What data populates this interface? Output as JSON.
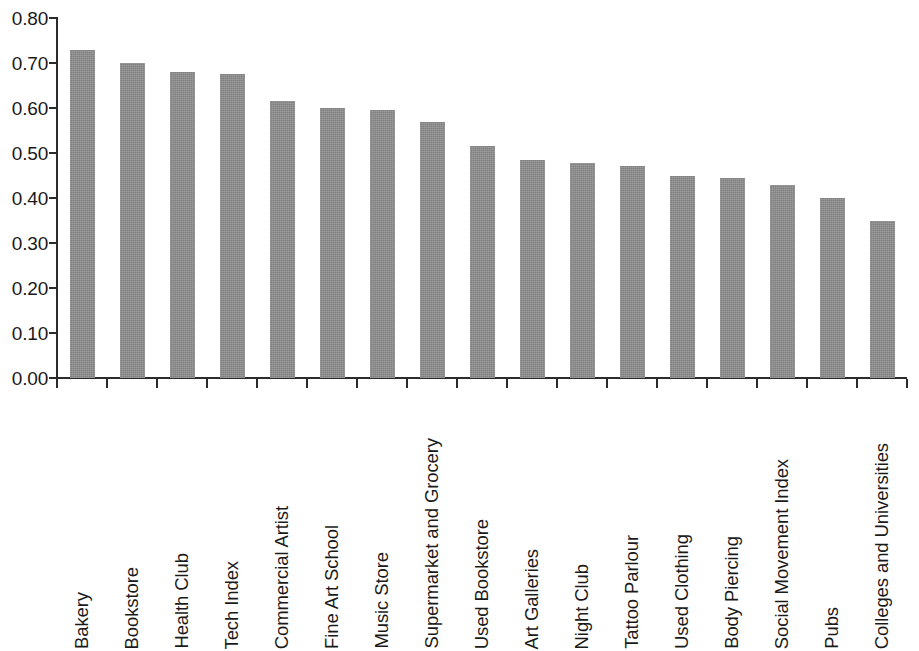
{
  "chart_data": {
    "type": "bar",
    "title": "",
    "subtitle": "",
    "xlabel": "",
    "ylabel": "",
    "ylim": [
      0.0,
      0.8
    ],
    "y_tick_labels": [
      "0.80",
      "0.70",
      "0.60",
      "0.50",
      "0.40",
      "0.30",
      "0.20",
      "0.10",
      "0.00"
    ],
    "y_tick_values": [
      0.8,
      0.7,
      0.6,
      0.5,
      0.4,
      0.3,
      0.2,
      0.1,
      0.0
    ],
    "grid": false,
    "legend": null,
    "bar_color": "#8d8d8d",
    "axis_color": "#2b2b2b",
    "categories": [
      "Bakery",
      "Bookstore",
      "Health Club",
      "Tech Index",
      "Commercial Artist",
      "Fine Art School",
      "Music Store",
      "Supermarket and Grocery",
      "Used Bookstore",
      "Art Galleries",
      "Night Club",
      "Tattoo Parlour",
      "Used Clothing",
      "Body Piercing",
      "Social Movement Index",
      "Pubs",
      "Colleges and Universities"
    ],
    "values": [
      0.73,
      0.7,
      0.68,
      0.675,
      0.615,
      0.6,
      0.595,
      0.57,
      0.515,
      0.485,
      0.478,
      0.472,
      0.45,
      0.445,
      0.428,
      0.4,
      0.348
    ]
  }
}
